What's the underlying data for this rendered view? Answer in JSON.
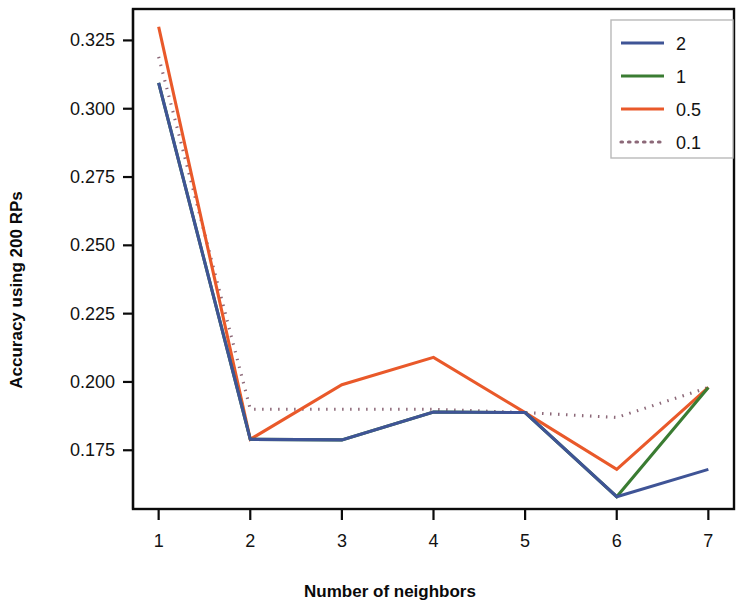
{
  "chart_data": {
    "type": "line",
    "title": "",
    "xlabel": "Number of neighbors",
    "ylabel": "Accuracy using 200 RPs",
    "x": [
      1,
      2,
      3,
      4,
      5,
      6,
      7
    ],
    "xticks": [
      "1",
      "2",
      "3",
      "4",
      "5",
      "6",
      "7"
    ],
    "yticks": [
      "0.175",
      "0.200",
      "0.225",
      "0.250",
      "0.275",
      "0.300",
      "0.325"
    ],
    "ytick_values": [
      0.175,
      0.2,
      0.225,
      0.25,
      0.275,
      0.3,
      0.325
    ],
    "xlim": [
      0.72,
      7.28
    ],
    "ylim": [
      0.1535,
      0.3365
    ],
    "grid": false,
    "legend_position": "top-right",
    "series": [
      {
        "name": "2",
        "style": "solid",
        "color": "#3f5496",
        "values": [
          0.3095,
          0.179,
          0.1788,
          0.189,
          0.1888,
          0.158,
          0.168
        ]
      },
      {
        "name": "1",
        "style": "solid",
        "color": "#3a7c32",
        "values": [
          0.3095,
          0.179,
          0.1788,
          0.189,
          0.1888,
          0.158,
          0.198
        ]
      },
      {
        "name": "0.5",
        "style": "solid",
        "color": "#e9592a",
        "values": [
          0.33,
          0.179,
          0.199,
          0.209,
          0.1888,
          0.168,
          0.198
        ]
      },
      {
        "name": "0.1",
        "style": "dotted",
        "color": "#8c6878",
        "values": [
          0.319,
          0.19,
          0.19,
          0.19,
          0.1888,
          0.187,
          0.198
        ]
      }
    ]
  },
  "legend": {
    "entries": [
      {
        "label": "2"
      },
      {
        "label": "1"
      },
      {
        "label": "0.5"
      },
      {
        "label": "0.1"
      }
    ]
  }
}
